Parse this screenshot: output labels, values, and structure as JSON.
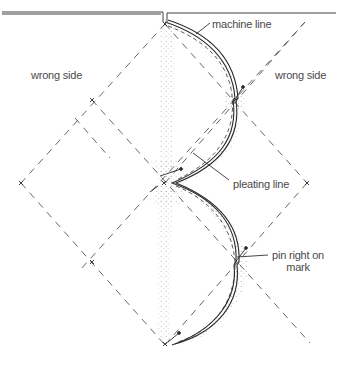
{
  "diagram": {
    "labels": {
      "wrong_side_left": "wrong side",
      "wrong_side_right": "wrong side",
      "machine_line": "machine line",
      "pleating_line": "pleating line",
      "pin_right_on_mark_line1": "pin right on",
      "pin_right_on_mark_line2": "mark"
    },
    "colors": {
      "stroke": "#2a2a2a",
      "dashed": "#555555",
      "dots": "#8a8a8a",
      "text": "#4a4a4a",
      "background": "#ffffff"
    }
  }
}
